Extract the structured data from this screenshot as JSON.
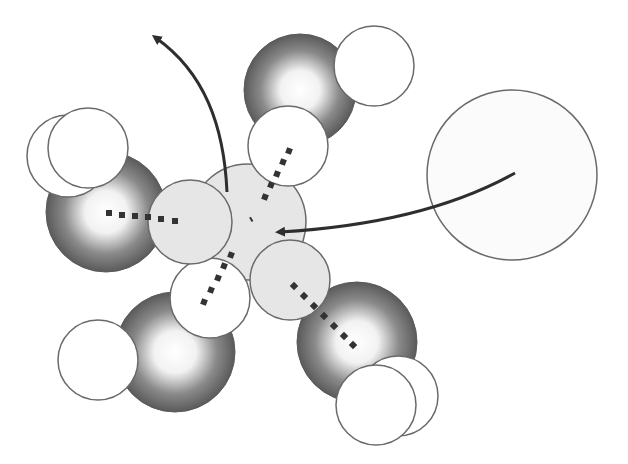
{
  "diagram": {
    "colors": {
      "background": "#ffffff",
      "oxygen_dark": "#5e5e5e",
      "oxygen_highlight": "#ffffff",
      "hydrogen_fill": "#ffffff",
      "ion_fill": "#e6e6e6",
      "incoming_ion_fill": "#fbfbfb",
      "outline": "#6a6a6a",
      "arrow": "#2e2e2e",
      "bond_dots": "#333333"
    },
    "elements": {
      "incoming_ion": {
        "cx": 512,
        "cy": 175,
        "r": 85
      },
      "central_ion": {
        "cx": 248,
        "cy": 222,
        "r": 58
      },
      "ion_lobes": [
        {
          "cx": 190,
          "cy": 222,
          "r": 42
        },
        {
          "cx": 290,
          "cy": 280,
          "r": 40
        }
      ],
      "water_molecules": [
        {
          "name": "top",
          "oxygen": {
            "cx": 302,
            "cy": 88,
            "r": 57
          },
          "hydrogens": [
            {
              "cx": 374,
              "cy": 66,
              "r": 40
            },
            {
              "cx": 288,
              "cy": 146,
              "r": 40
            }
          ]
        },
        {
          "name": "left",
          "oxygen": {
            "cx": 105,
            "cy": 210,
            "r": 60
          },
          "hydrogens": [
            {
              "cx": 68,
              "cy": 156,
              "r": 41
            },
            {
              "cx": 88,
              "cy": 148,
              "r": 40
            }
          ]
        },
        {
          "name": "lower-left",
          "oxygen": {
            "cx": 175,
            "cy": 350,
            "r": 60
          },
          "hydrogens": [
            {
              "cx": 98,
              "cy": 360,
              "r": 40
            },
            {
              "cx": 210,
              "cy": 298,
              "r": 40
            }
          ]
        },
        {
          "name": "lower-right",
          "oxygen": {
            "cx": 357,
            "cy": 340,
            "r": 60
          },
          "hydrogens": [
            {
              "cx": 398,
              "cy": 395,
              "r": 40
            },
            {
              "cx": 376,
              "cy": 405,
              "r": 40
            }
          ]
        }
      ],
      "arrows": [
        {
          "name": "incoming-arrow",
          "path": "M515 173 C440 215 350 228 272 232",
          "head_at": [
            270,
            232
          ]
        },
        {
          "name": "outgoing-arrow",
          "path": "M226 190 C222 120 200 70 152 36",
          "head_at": [
            148,
            32
          ]
        }
      ]
    },
    "labels": []
  }
}
